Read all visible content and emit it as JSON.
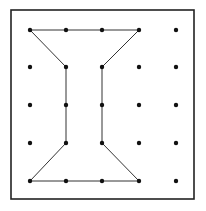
{
  "diagram": {
    "type": "geoboard",
    "frame": {
      "x": 11,
      "y": 10,
      "width": 183,
      "height": 189,
      "stroke": "#222222"
    },
    "grid": {
      "cols": 5,
      "rows": 5,
      "x": [
        30,
        66,
        102,
        139,
        176
      ],
      "y": [
        30,
        67,
        105,
        143,
        181
      ],
      "dot_radius": 2.2,
      "dot_color": "#111111"
    },
    "shape": {
      "name": "I-beam polygon",
      "stroke": "#333333",
      "vertices_grid": [
        [
          0,
          0
        ],
        [
          3,
          0
        ],
        [
          2,
          1
        ],
        [
          2,
          3
        ],
        [
          3,
          4
        ],
        [
          0,
          4
        ],
        [
          1,
          3
        ],
        [
          1,
          1
        ]
      ]
    }
  }
}
